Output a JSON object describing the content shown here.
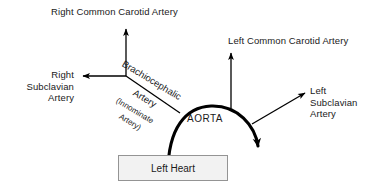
{
  "diagram": {
    "background_color": "#ffffff",
    "stroke_color": "#000000",
    "text_color": "#1a1a1a",
    "labels": {
      "right_common_carotid": "Right Common Carotid Artery",
      "left_common_carotid": "Left Common Carotid Artery",
      "right_subclavian": "Right\nSubclavian\nArtery",
      "left_subclavian": "Left\nSubclavian\nArtery",
      "aorta": "AORTA",
      "brachiocephalic_line1": "Brachiocephalic",
      "brachiocephalic_line2": "Artery",
      "innominate_line1": "(Innominate",
      "innominate_line2": "Artery)",
      "left_heart": "Left Heart"
    },
    "box": {
      "fill_color": "#f2f2f2",
      "border_color": "#949494"
    }
  }
}
